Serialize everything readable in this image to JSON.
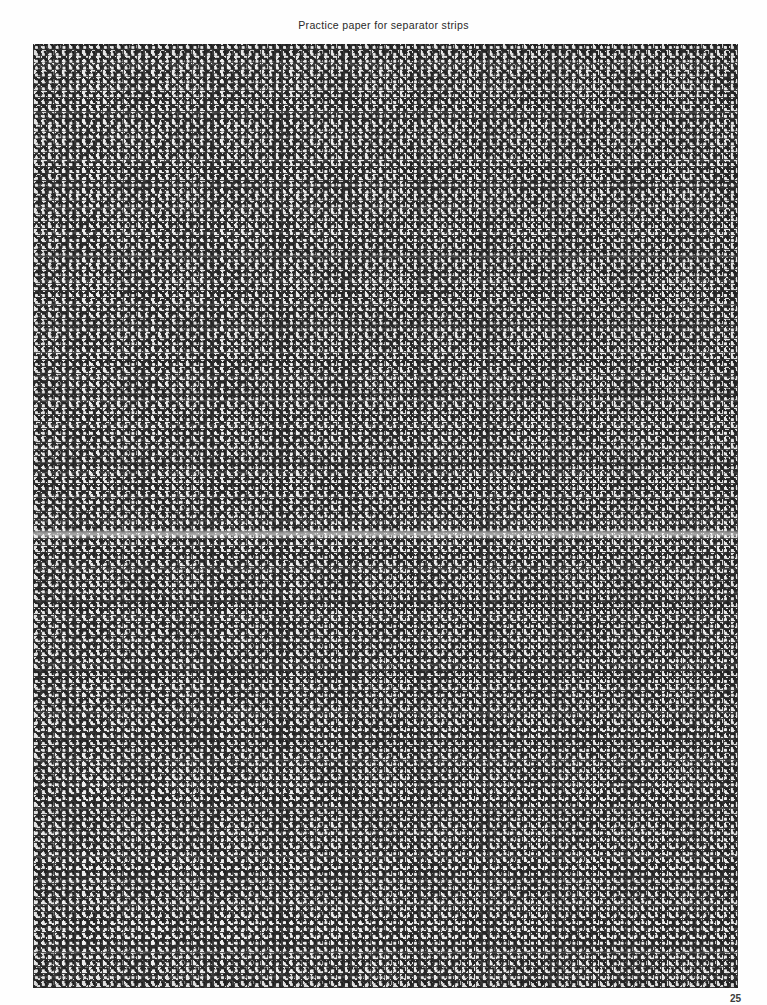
{
  "document": {
    "title": "Practice paper for separator strips",
    "page_number": "25",
    "footer_note": "",
    "background_color": "#fefefe"
  },
  "swatch": {
    "name": "practice-paper-grid",
    "description": "Dense cross-stitch practice grid of plus/cross motifs",
    "pattern_type": "cross-stitch-plus-lattice",
    "dark_color": "#1b1b1b",
    "mid_color": "#3a3a3a",
    "light_color": "#ededed",
    "cell_pitch_px": "6.9",
    "left_px": "33",
    "top_px": "44",
    "width_px": "705",
    "height_px": "944",
    "streak_top_px": "485"
  }
}
